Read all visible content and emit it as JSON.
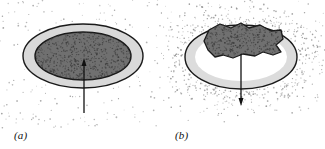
{
  "figure": {
    "type": "scientific-diagram",
    "background_color": "#ffffff",
    "width": 325,
    "height": 149,
    "panel_count": 2
  },
  "panels": [
    {
      "id": "a",
      "label": "(a)",
      "description": "Oval with light-gray outer rim and dark stippled core; stippled field outside the oval; arrow points inward/upward into the dark core.",
      "outer_ellipse": {
        "cx": 83,
        "cy": 56,
        "rx": 60,
        "ry": 32,
        "fill": "#d9d9d9",
        "stroke": "#1a1a1a",
        "stroke_width": 1.4
      },
      "inner_ellipse": {
        "cx": 83,
        "cy": 56,
        "rx": 48,
        "ry": 24,
        "fill": "#707070",
        "stroke": "#1a1a1a",
        "stroke_width": 1.4
      },
      "stipple": {
        "region": "outside-ellipse",
        "dot_color": "#8c8c8c",
        "density": "sparse-uniform",
        "dot_count": 150
      },
      "core_stipple": {
        "region": "inner-ellipse",
        "dot_color": "#3c3c3c",
        "density": "dense",
        "dot_count": 620
      },
      "arrow": {
        "direction": "up",
        "x": 84,
        "tail_y": 113,
        "head_y": 58,
        "color": "#111111",
        "line_width": 1.3,
        "head_length": 8,
        "head_width": 5
      }
    },
    {
      "id": "b",
      "label": "(b)",
      "description": "Oval with light-gray rim and white interior containing a dark irregular stippled blob; dense stippled halo outside the oval; arrow points outward/downward from the blob.",
      "outer_ellipse": {
        "cx": 78,
        "cy": 57,
        "rx": 56,
        "ry": 32,
        "fill": "#dcdcdc",
        "stroke": "#1a1a1a",
        "stroke_width": 1.4
      },
      "inner_ellipse": {
        "cx": 78,
        "cy": 57,
        "rx": 46,
        "ry": 24,
        "fill": "#ffffff",
        "stroke": "none",
        "stroke_width": 0
      },
      "blob": {
        "fill": "#707070",
        "stroke": "#1a1a1a",
        "stroke_width": 1.3,
        "shape": "irregular-polygon",
        "points": "46,30 57,24 68,28 78,23 86,28 97,25 108,31 118,30 120,39 113,45 118,52 110,55 100,52 92,56 80,54 70,58 60,55 52,57 45,50 41,41"
      },
      "blob_stipple": {
        "dot_color": "#3c3c3c",
        "density": "dense",
        "dot_count": 380
      },
      "stipple": {
        "region": "outside-ellipse-halo",
        "dot_color": "#8c8c8c",
        "density": "dense-near-edge",
        "dot_count": 520
      },
      "arrow": {
        "direction": "down",
        "x": 78,
        "tail_y": 54,
        "head_y": 106,
        "color": "#111111",
        "line_width": 1.3,
        "head_length": 8,
        "head_width": 5
      }
    }
  ],
  "chart_data": {
    "type": "diagram",
    "title": "",
    "xlabel": "",
    "ylabel": "",
    "annotations": [
      "(a)",
      "(b)"
    ],
    "series": [
      {
        "name": "(a) inward arrow",
        "values": [
          1
        ]
      },
      {
        "name": "(b) outward arrow",
        "values": [
          -1
        ]
      }
    ]
  }
}
